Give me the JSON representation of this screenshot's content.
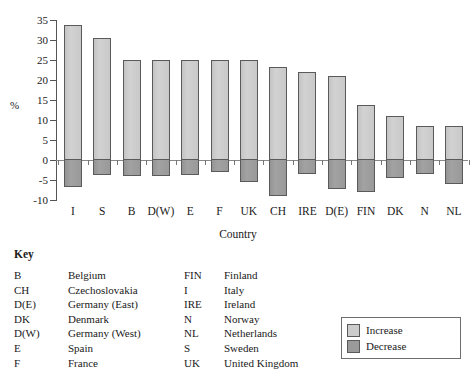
{
  "chart_data": {
    "type": "bar",
    "title": "",
    "subtitle": "",
    "xlabel": "Country",
    "ylabel": "%",
    "ylim": [
      -10,
      35
    ],
    "ytick_labels": [
      "35",
      "30",
      "25",
      "20",
      "15",
      "10",
      "5",
      "0",
      "-5",
      "-10"
    ],
    "ytick_values": [
      35,
      30,
      25,
      20,
      15,
      10,
      5,
      0,
      -5,
      -10
    ],
    "grid": false,
    "legend_position": "bottom-right",
    "categories": [
      "I",
      "S",
      "B",
      "D(W)",
      "E",
      "F",
      "UK",
      "CH",
      "IRE",
      "D(E)",
      "FIN",
      "DK",
      "N",
      "NL"
    ],
    "series": [
      {
        "name": "Increase",
        "color": "#cccccc",
        "values": [
          33.7,
          30.6,
          25.0,
          25.0,
          25.0,
          25.0,
          25.0,
          23.3,
          22.0,
          21.0,
          13.7,
          11.0,
          8.6,
          8.4
        ]
      },
      {
        "name": "Decrease",
        "color": "#9a9a9a",
        "values": [
          -6.7,
          -3.7,
          -4.0,
          -4.0,
          -3.8,
          -3.1,
          -5.4,
          -9.1,
          -3.5,
          -7.3,
          -7.9,
          -4.4,
          -3.6,
          -6.1
        ]
      }
    ]
  },
  "legend": {
    "items": [
      {
        "label": "Increase",
        "swatch": "increase"
      },
      {
        "label": "Decrease",
        "swatch": "decrease"
      }
    ]
  },
  "key": {
    "heading": "Key",
    "left_column": [
      {
        "abbr": "B",
        "name": "Belgium"
      },
      {
        "abbr": "CH",
        "name": "Czechoslovakia"
      },
      {
        "abbr": "D(E)",
        "name": "Germany (East)"
      },
      {
        "abbr": "DK",
        "name": "Denmark"
      },
      {
        "abbr": "D(W)",
        "name": "Germany (West)"
      },
      {
        "abbr": "E",
        "name": "Spain"
      },
      {
        "abbr": "F",
        "name": "France"
      }
    ],
    "right_column": [
      {
        "abbr": "FIN",
        "name": "Finland"
      },
      {
        "abbr": "I",
        "name": "Italy"
      },
      {
        "abbr": "IRE",
        "name": "Ireland"
      },
      {
        "abbr": "N",
        "name": "Norway"
      },
      {
        "abbr": "NL",
        "name": "Netherlands"
      },
      {
        "abbr": "S",
        "name": "Sweden"
      },
      {
        "abbr": "UK",
        "name": "United Kingdom"
      }
    ]
  }
}
